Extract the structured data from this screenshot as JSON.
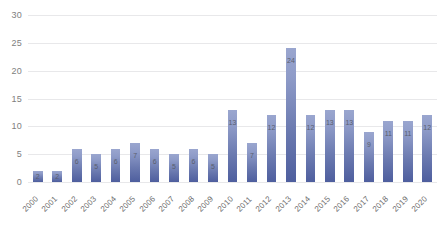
{
  "chart_data": {
    "type": "bar",
    "title": "",
    "subtitle": "",
    "xlabel": "",
    "ylabel": "",
    "ylim": [
      0,
      30
    ],
    "y_ticks": [
      0,
      5,
      10,
      15,
      20,
      25,
      30
    ],
    "grid": true,
    "legend": "none",
    "data_labels_shown": true,
    "categories": [
      "2000",
      "2001",
      "2002",
      "2003",
      "2004",
      "2005",
      "2006",
      "2007",
      "2008",
      "2009",
      "2010",
      "2011",
      "2012",
      "2013",
      "2014",
      "2015",
      "2016",
      "2017",
      "2018",
      "2019",
      "2020"
    ],
    "values": [
      2,
      2,
      6,
      5,
      6,
      7,
      6,
      5,
      6,
      5,
      13,
      7,
      12,
      24,
      12,
      13,
      13,
      9,
      11,
      11,
      12
    ],
    "colors": {
      "bar_top": "#9aa6cf",
      "bar_bottom": "#4e5e9e",
      "gridline": "#e8e8ea",
      "tick_text": "#6d6d6d",
      "data_label_text": "#5a5f6e",
      "background": "#ffffff"
    }
  }
}
